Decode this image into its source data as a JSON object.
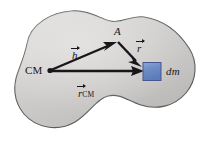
{
  "figure": {
    "type": "physics-vector-diagram",
    "background_color": "#ffffff",
    "body": {
      "name": "rigid-body-blob",
      "fill_color": "#c7c6c4",
      "fill_color_light": "#d7d6d4",
      "outline_color": "#5c5c5e"
    },
    "points": [
      {
        "id": "cm",
        "label": "CM",
        "x": 48,
        "y": 70,
        "marker": "dot",
        "color": "#17171a"
      },
      {
        "id": "a",
        "label": "A",
        "x": 118,
        "y": 40,
        "marker": "vertex",
        "color": "#17171a"
      },
      {
        "id": "dm",
        "label": "dm",
        "x": 152,
        "y": 72,
        "marker": "square",
        "color": "#6c8cc6"
      }
    ],
    "vectors": [
      {
        "id": "h",
        "label": "h",
        "subscript": "",
        "from": "cm",
        "to": "a",
        "color": "#17171a"
      },
      {
        "id": "r",
        "label": "r",
        "subscript": "",
        "from": "a",
        "to": "dm",
        "color": "#17171a"
      },
      {
        "id": "r_cm",
        "label": "r",
        "subscript": "CM",
        "from": "cm",
        "to": "dm",
        "color": "#17171a"
      }
    ],
    "labels": {
      "cm": "CM",
      "a": "A",
      "dm": "dm",
      "h_vector": "h",
      "r_vector": "r",
      "rcm_vector": "r",
      "rcm_subscript": "CM"
    },
    "mass_element": {
      "name": "dm-square",
      "fill_color": "#6c8cc6",
      "border_color": "#44548c"
    }
  }
}
